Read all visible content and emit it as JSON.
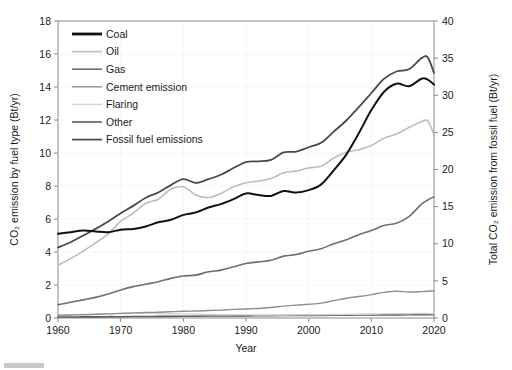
{
  "chart_data": {
    "type": "line",
    "title": "",
    "xlabel": "Year",
    "ylabel": "CO₂ emission by fuel type (Bt/yr)",
    "y2label": "Total CO₂ emission from fossil fuel (Bt/yr)",
    "xlim": [
      1960,
      2020
    ],
    "ylim": [
      0,
      18
    ],
    "y2lim": [
      0,
      40
    ],
    "xticks": [
      1960,
      1970,
      1980,
      1990,
      2000,
      2010,
      2020
    ],
    "yticks": [
      0,
      2,
      4,
      6,
      8,
      10,
      12,
      14,
      16,
      18
    ],
    "y2ticks": [
      0,
      5,
      10,
      15,
      20,
      25,
      30,
      35,
      40
    ],
    "grid": false,
    "legend_position": "upper left",
    "x": [
      1960,
      1962,
      1964,
      1966,
      1968,
      1970,
      1972,
      1974,
      1976,
      1978,
      1980,
      1982,
      1984,
      1986,
      1988,
      1990,
      1992,
      1994,
      1996,
      1998,
      2000,
      2002,
      2004,
      2006,
      2008,
      2010,
      2012,
      2014,
      2016,
      2018,
      2019,
      2020
    ],
    "series": [
      {
        "name": "Coal",
        "color": "#111111",
        "width": 2.0,
        "axis": "left",
        "values": [
          5.1,
          5.2,
          5.3,
          5.25,
          5.2,
          5.35,
          5.4,
          5.55,
          5.8,
          5.95,
          6.25,
          6.4,
          6.7,
          6.9,
          7.2,
          7.55,
          7.45,
          7.4,
          7.7,
          7.6,
          7.75,
          8.1,
          8.95,
          9.9,
          11.2,
          12.6,
          13.7,
          14.2,
          14.05,
          14.5,
          14.45,
          14.15
        ]
      },
      {
        "name": "Oil",
        "color": "#bdbdbd",
        "width": 1.6,
        "axis": "left",
        "values": [
          3.2,
          3.6,
          4.05,
          4.55,
          5.1,
          5.85,
          6.35,
          6.95,
          7.2,
          7.8,
          7.95,
          7.45,
          7.3,
          7.55,
          7.95,
          8.2,
          8.3,
          8.45,
          8.8,
          8.9,
          9.1,
          9.2,
          9.7,
          10.05,
          10.2,
          10.45,
          10.9,
          11.15,
          11.55,
          11.9,
          11.95,
          11.1
        ]
      },
      {
        "name": "Gas",
        "color": "#6f6f6f",
        "width": 1.6,
        "axis": "left",
        "values": [
          0.8,
          0.95,
          1.1,
          1.25,
          1.45,
          1.7,
          1.9,
          2.05,
          2.2,
          2.4,
          2.55,
          2.6,
          2.8,
          2.9,
          3.1,
          3.3,
          3.4,
          3.5,
          3.75,
          3.85,
          4.05,
          4.2,
          4.5,
          4.75,
          5.05,
          5.3,
          5.6,
          5.75,
          6.15,
          6.9,
          7.15,
          7.35
        ]
      },
      {
        "name": "Cement emission",
        "color": "#8f8f8f",
        "width": 1.4,
        "axis": "left",
        "values": [
          0.16,
          0.18,
          0.2,
          0.22,
          0.25,
          0.28,
          0.31,
          0.33,
          0.35,
          0.38,
          0.41,
          0.42,
          0.45,
          0.48,
          0.52,
          0.55,
          0.58,
          0.64,
          0.72,
          0.78,
          0.83,
          0.9,
          1.05,
          1.2,
          1.3,
          1.42,
          1.55,
          1.62,
          1.58,
          1.6,
          1.62,
          1.65
        ]
      },
      {
        "name": "Flaring",
        "color": "#d2d2d2",
        "width": 1.4,
        "axis": "left",
        "values": [
          0.18,
          0.2,
          0.22,
          0.24,
          0.26,
          0.27,
          0.28,
          0.28,
          0.27,
          0.26,
          0.25,
          0.23,
          0.21,
          0.2,
          0.19,
          0.19,
          0.18,
          0.18,
          0.18,
          0.19,
          0.19,
          0.2,
          0.21,
          0.22,
          0.23,
          0.24,
          0.25,
          0.26,
          0.26,
          0.27,
          0.27,
          0.25
        ]
      },
      {
        "name": "Other",
        "color": "#5a5a5a",
        "width": 1.6,
        "axis": "left",
        "values": [
          0.06,
          0.06,
          0.07,
          0.07,
          0.08,
          0.08,
          0.09,
          0.09,
          0.1,
          0.1,
          0.11,
          0.11,
          0.12,
          0.12,
          0.13,
          0.13,
          0.14,
          0.14,
          0.15,
          0.15,
          0.16,
          0.16,
          0.17,
          0.17,
          0.18,
          0.18,
          0.19,
          0.19,
          0.2,
          0.2,
          0.2,
          0.2
        ]
      },
      {
        "name": "Fossil fuel emissions",
        "color": "#4a4a4a",
        "width": 1.8,
        "axis": "right",
        "values": [
          9.5,
          10.2,
          11.1,
          12.0,
          13.0,
          14.1,
          15.1,
          16.2,
          16.9,
          17.9,
          18.7,
          18.2,
          18.7,
          19.3,
          20.2,
          21.0,
          21.1,
          21.3,
          22.3,
          22.4,
          23.0,
          23.6,
          25.1,
          26.6,
          28.4,
          30.3,
          32.2,
          33.2,
          33.5,
          35.0,
          35.1,
          33.0
        ]
      }
    ]
  },
  "legend": {
    "items": [
      {
        "label": "Coal"
      },
      {
        "label": "Oil"
      },
      {
        "label": "Gas"
      },
      {
        "label": "Cement emission"
      },
      {
        "label": "Flaring"
      },
      {
        "label": "Other"
      },
      {
        "label": "Fossil fuel emissions"
      }
    ]
  }
}
